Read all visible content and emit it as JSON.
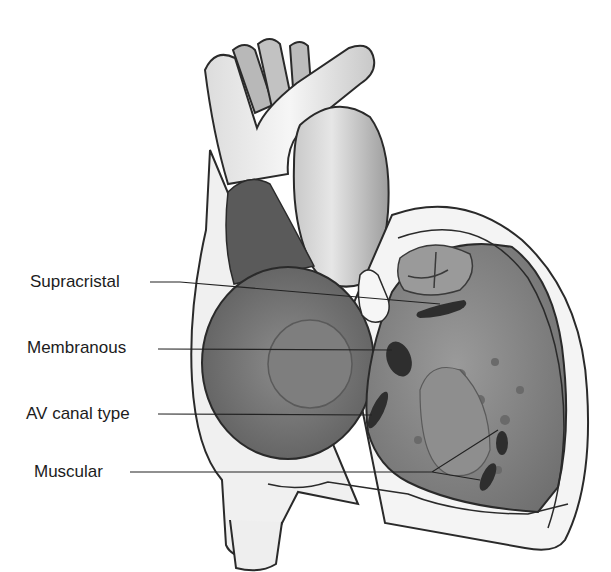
{
  "figure": {
    "labels": [
      {
        "id": "supracristal",
        "text": "Supracristal",
        "x": 30,
        "y": 272
      },
      {
        "id": "membranous",
        "text": "Membranous",
        "x": 27,
        "y": 338
      },
      {
        "id": "av-canal",
        "text": "AV canal type",
        "x": 26,
        "y": 404
      },
      {
        "id": "muscular",
        "text": "Muscular",
        "x": 34,
        "y": 469
      }
    ]
  },
  "colors": {
    "outline": "#2a2a2a",
    "vessel": "#e8e8e8",
    "cavity_dark": "#6a6a6a",
    "cavity_mid": "#8a8a8a",
    "wall": "#f2f2f2",
    "defect": "#2e2e2e"
  }
}
